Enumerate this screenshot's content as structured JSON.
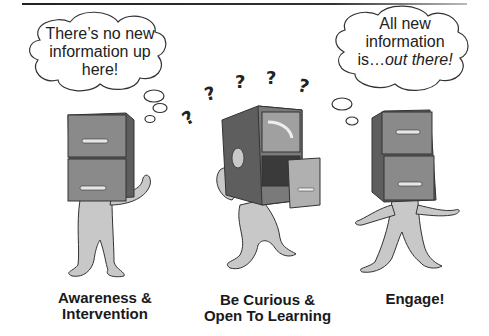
{
  "figure": {
    "panels": [
      {
        "thought_line1": "There’s no new",
        "thought_line2": "information up",
        "thought_line3": "here!",
        "caption_line1": "Awareness &",
        "caption_line2": "Intervention"
      },
      {
        "thought_symbols": "? ? ? ? ?",
        "caption_line1": "Be Curious &",
        "caption_line2": "Open To Learning"
      },
      {
        "thought_line1": "All new",
        "thought_line2": "information",
        "thought_line3_plain": "is…",
        "thought_line3_italic": "out there!",
        "caption_line1": "Engage!"
      }
    ],
    "colors": {
      "cabinet_dark": "#6e6e6e",
      "cabinet_front": "#8a8a8a",
      "body_gray": "#c8c8c8",
      "outline": "#333333"
    }
  }
}
